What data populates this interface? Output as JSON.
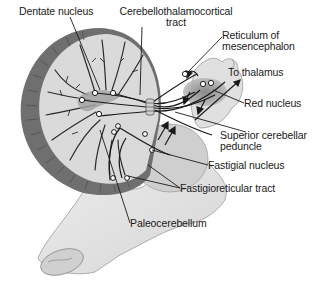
{
  "figure": {
    "colors": {
      "background": "#ffffff",
      "cortex_light": "#d9d9d9",
      "cortex_dark": "#6f6f6f",
      "nucleus_shade": "#9a9a9a",
      "brainstem": "#e4e4e4",
      "line": "#1a1a1a"
    }
  },
  "labels": {
    "dentate_nucleus": "Dentate nucleus",
    "cerebellothalamocortical_line1": "Cerebellothalamocortical",
    "cerebellothalamocortical_line2": "tract",
    "reticulum_line1": "Reticulum of",
    "reticulum_line2": "mesencephalon",
    "to_thalamus": "To thalamus",
    "red_nucleus": "Red nucleus",
    "superior_cerebellar_line1": "Superior cerebellar",
    "superior_cerebellar_line2": "peduncle",
    "fastigial_nucleus": "Fastigial nucleus",
    "fastigioreticular_tract": "Fastigioreticular tract",
    "paleocerebellum": "Paleocerebellum"
  }
}
